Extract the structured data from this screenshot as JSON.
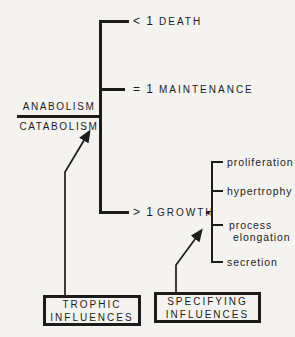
{
  "diagram": {
    "fraction": {
      "numerator": "ANABOLISM",
      "denominator": "CATABOLISM"
    },
    "branches": [
      {
        "ratio": "< 1",
        "label": "DEATH"
      },
      {
        "ratio": "= 1",
        "label": "MAINTENANCE"
      },
      {
        "ratio": "> 1",
        "label": "GROWTH",
        "marker": "◄"
      }
    ],
    "growth_outcomes": [
      {
        "label": "proliferation"
      },
      {
        "label": "hypertrophy"
      },
      {
        "label": "process",
        "label2": "elongation"
      },
      {
        "label": "secretion"
      }
    ],
    "influence_boxes": [
      {
        "line1": "TROPHIC",
        "line2": "INFLUENCES"
      },
      {
        "line1": "SPECIFYING",
        "line2": "INFLUENCES"
      }
    ],
    "colors": {
      "ink": "#1c1c1c",
      "background": "#f4f3ef"
    }
  }
}
